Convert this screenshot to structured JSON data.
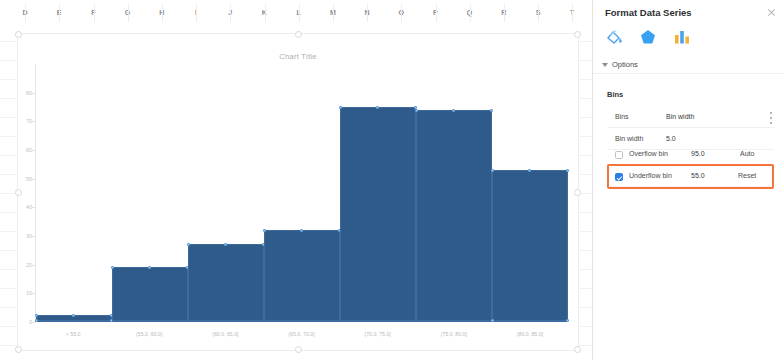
{
  "spreadsheet": {
    "columns": [
      "D",
      "E",
      "F",
      "G",
      "H",
      "I",
      "J",
      "K",
      "L",
      "M",
      "N",
      "O",
      "P",
      "Q",
      "R",
      "S",
      "T"
    ]
  },
  "chart": {
    "title": "Chart Title",
    "selected": true
  },
  "chart_data": {
    "type": "bar",
    "title": "Chart Title",
    "xlabel": "",
    "ylabel": "",
    "categories": [
      "< 55.0",
      "(55.0, 60.0]",
      "(60.0, 65.0]",
      "(65.0, 70.0]",
      "(70.0, 75.0]",
      "(75.0, 80.0]",
      "(80.0, 85.0]"
    ],
    "values": [
      2,
      19,
      27,
      32,
      75,
      74,
      53
    ],
    "ylim": [
      0,
      90
    ],
    "yticks": [
      0,
      10,
      20,
      30,
      40,
      50,
      60,
      70,
      80
    ],
    "ytick_labels": [
      "0",
      "10",
      "20",
      "30",
      "40",
      "50",
      "60",
      "70",
      "80"
    ],
    "grid": false,
    "legend": false,
    "series_color": "#2f5b8a"
  },
  "pane": {
    "title": "Format Data Series",
    "close_label": "close",
    "tabs": [
      {
        "name": "fill-and-line",
        "icon": "paint-bucket-icon"
      },
      {
        "name": "effects",
        "icon": "pentagon-icon"
      },
      {
        "name": "series-options",
        "icon": "bar-chart-icon"
      }
    ],
    "options_label": "Options",
    "bins_header": "Bins",
    "rows": {
      "bins": {
        "label": "Bins",
        "value": "Bin width",
        "menu": "more-options"
      },
      "bin_width": {
        "label": "Bin width",
        "value": "5.0"
      },
      "overflow": {
        "label": "Overflow bin",
        "value": "95.0",
        "action": "Auto",
        "checked": false
      },
      "underflow": {
        "label": "Underflow bin",
        "value": "55.0",
        "action": "Reset",
        "checked": true
      }
    },
    "highlight_color": "#f4743b",
    "accent_color": "#2b7de9"
  }
}
